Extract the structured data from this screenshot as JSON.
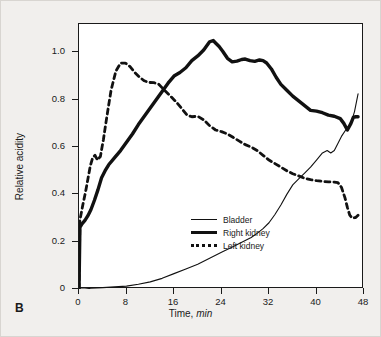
{
  "figure": {
    "panel_label": "B",
    "background_color": "#f1efed",
    "plot_background": "#ffffff",
    "axis_color": "#1a1a1a"
  },
  "chart_data": {
    "type": "line",
    "title": "",
    "xlabel_prefix": "Time, ",
    "xlabel_unit": "min",
    "ylabel": "Relative acidity",
    "xlim": [
      0,
      48
    ],
    "ylim": [
      0,
      1.12
    ],
    "xticks": [
      0,
      8,
      16,
      24,
      32,
      40,
      48
    ],
    "xtick_labels": [
      "0",
      "8",
      "16",
      "24",
      "32",
      "40",
      "48"
    ],
    "yticks": [
      0,
      0.2,
      0.4,
      0.6,
      0.8,
      1.0
    ],
    "ytick_labels": [
      "0",
      "0.2",
      "0.4",
      "0.6",
      "0.8",
      "1.0"
    ],
    "grid": false,
    "legend_position": "lower-right",
    "series": [
      {
        "name": "Bladder",
        "style": "thin-solid",
        "color": "#111111",
        "width": 1.1,
        "x": [
          0,
          0.3,
          1,
          2,
          4,
          6,
          8,
          10,
          12,
          14,
          16,
          18,
          20,
          22,
          24,
          26,
          28,
          29,
          30,
          31,
          32,
          33,
          34,
          35,
          36,
          37,
          38,
          39,
          40,
          41,
          41.8,
          42.4,
          43,
          43.6,
          44.2,
          45,
          45.8,
          46.4,
          47
        ],
        "y": [
          0,
          0,
          0,
          0.003,
          0.006,
          0.009,
          0.012,
          0.02,
          0.03,
          0.045,
          0.065,
          0.085,
          0.105,
          0.13,
          0.155,
          0.18,
          0.205,
          0.218,
          0.235,
          0.255,
          0.28,
          0.315,
          0.355,
          0.4,
          0.44,
          0.465,
          0.49,
          0.515,
          0.545,
          0.575,
          0.585,
          0.575,
          0.585,
          0.615,
          0.645,
          0.675,
          0.7,
          0.75,
          0.825
        ]
      },
      {
        "name": "Right kidney",
        "style": "thick-solid",
        "color": "#111111",
        "width": 3.4,
        "x": [
          0,
          0.15,
          0.5,
          1,
          1.5,
          2,
          2.6,
          3.2,
          3.8,
          4.4,
          5,
          6,
          7,
          8,
          9,
          10,
          11,
          12,
          13,
          14,
          15,
          16,
          17,
          18,
          19,
          20,
          21,
          22,
          22.6,
          23,
          23.6,
          24.2,
          25,
          25.8,
          26.6,
          27.4,
          28,
          28.8,
          29.6,
          30.4,
          31,
          31.6,
          32.4,
          33.2,
          34,
          35,
          36,
          37,
          38,
          39,
          40,
          41,
          42,
          43,
          44,
          44.6,
          45.2,
          45.8,
          46.2,
          46.6,
          47
        ],
        "y": [
          0,
          0.26,
          0.275,
          0.29,
          0.31,
          0.335,
          0.375,
          0.42,
          0.47,
          0.5,
          0.525,
          0.555,
          0.585,
          0.62,
          0.655,
          0.695,
          0.73,
          0.765,
          0.8,
          0.835,
          0.87,
          0.9,
          0.915,
          0.935,
          0.965,
          0.985,
          1.01,
          1.045,
          1.05,
          1.04,
          1.025,
          1.005,
          0.975,
          0.96,
          0.963,
          0.97,
          0.972,
          0.965,
          0.962,
          0.968,
          0.965,
          0.955,
          0.93,
          0.895,
          0.865,
          0.84,
          0.815,
          0.795,
          0.775,
          0.755,
          0.752,
          0.745,
          0.735,
          0.73,
          0.72,
          0.7,
          0.672,
          0.7,
          0.725,
          0.728,
          0.728
        ]
      },
      {
        "name": "Left kidney",
        "style": "dashed",
        "color": "#111111",
        "width": 2.8,
        "dash": "5,4",
        "x": [
          0,
          0.15,
          0.6,
          1.1,
          1.5,
          1.9,
          2.3,
          2.7,
          3.1,
          3.6,
          4.1,
          4.7,
          5.4,
          6.2,
          7,
          7.8,
          8.6,
          9.4,
          10.2,
          11,
          11.8,
          12.6,
          13.4,
          14.4,
          15.4,
          16.4,
          17.4,
          18.2,
          19,
          20,
          21,
          22,
          23,
          24,
          25,
          26,
          27,
          28,
          29,
          30,
          31,
          32,
          33,
          34,
          35,
          36,
          37,
          38,
          39,
          40,
          41,
          42,
          43,
          43.6,
          44.2,
          44.8,
          45.2,
          45.6,
          46,
          46.6,
          47
        ],
        "y": [
          0,
          0.29,
          0.35,
          0.41,
          0.465,
          0.52,
          0.555,
          0.565,
          0.545,
          0.56,
          0.63,
          0.73,
          0.84,
          0.92,
          0.955,
          0.955,
          0.94,
          0.915,
          0.895,
          0.88,
          0.873,
          0.872,
          0.866,
          0.84,
          0.815,
          0.79,
          0.76,
          0.735,
          0.728,
          0.73,
          0.715,
          0.69,
          0.672,
          0.665,
          0.655,
          0.64,
          0.625,
          0.61,
          0.6,
          0.585,
          0.565,
          0.545,
          0.53,
          0.515,
          0.5,
          0.487,
          0.478,
          0.468,
          0.462,
          0.458,
          0.455,
          0.453,
          0.452,
          0.45,
          0.43,
          0.385,
          0.345,
          0.312,
          0.3,
          0.302,
          0.312
        ]
      }
    ],
    "legend_entries": [
      {
        "label": "Bladder",
        "style": "thin-solid"
      },
      {
        "label": "Right kidney",
        "style": "thick-solid"
      },
      {
        "label": "Left kidney",
        "style": "dashed"
      }
    ]
  }
}
